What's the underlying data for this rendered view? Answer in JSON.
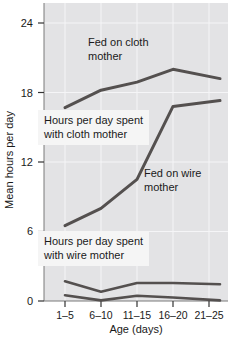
{
  "chart_data": {
    "type": "line",
    "categories": [
      "1–5",
      "6–10",
      "11–15",
      "16–20",
      "21–25"
    ],
    "xlabel": "Age (days)",
    "ylabel": "Mean hours per day",
    "ylim": [
      0,
      25.7
    ],
    "yticks": [
      0,
      6,
      12,
      18,
      24
    ],
    "grid": true,
    "legend_position": "none",
    "background": "#e3e3e5",
    "line_color": "#54504f",
    "series": [
      {
        "name": "Fed on cloth mother (time with cloth mother)",
        "values": [
          16.7,
          18.2,
          18.9,
          20.0,
          19.2
        ]
      },
      {
        "name": "Fed on wire mother (time with cloth mother)",
        "values": [
          6.5,
          8.0,
          10.5,
          16.8,
          17.3
        ]
      },
      {
        "name": "Fed on wire mother (time with wire mother)",
        "values": [
          1.7,
          0.8,
          1.55,
          1.55,
          1.45
        ]
      },
      {
        "name": "Fed on cloth mother (time with wire mother)",
        "values": [
          0.5,
          0.05,
          0.45,
          0.3,
          0.05
        ]
      }
    ],
    "annotations": [
      {
        "text": "Fed on cloth\nmother",
        "boxed": false
      },
      {
        "text": "Hours per day spent\nwith cloth mother",
        "boxed": true
      },
      {
        "text": "Fed on wire\nmother",
        "boxed": false
      },
      {
        "text": "Hours per day spent\nwith wire mother",
        "boxed": true
      }
    ]
  }
}
